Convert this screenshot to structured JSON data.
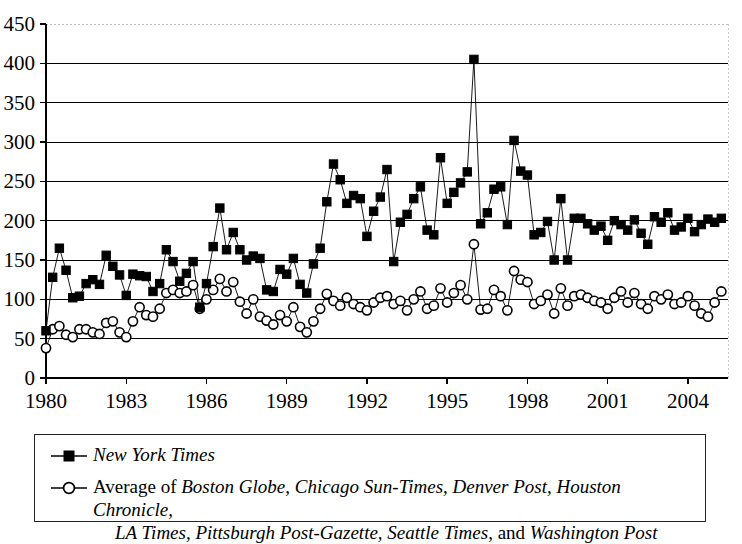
{
  "chart_data": {
    "type": "line",
    "title": "",
    "subtitle": "",
    "xlabel": "",
    "ylabel": "",
    "xlim": [
      1980,
      2005.5
    ],
    "ylim": [
      0,
      450
    ],
    "y_ticks": [
      0,
      50,
      100,
      150,
      200,
      250,
      300,
      350,
      400,
      450
    ],
    "x_ticks": [
      1980,
      1983,
      1986,
      1989,
      1992,
      1995,
      1998,
      2001,
      2004
    ],
    "x_tick_labels": [
      "1980",
      "1983",
      "1986",
      "1989",
      "1992",
      "1995",
      "1998",
      "2001",
      "2004"
    ],
    "grid": "horizontal",
    "legend_position": "below-plot",
    "frequency": "quarterly",
    "series": [
      {
        "name": "New York Times",
        "marker": "filled-square",
        "color": "#000000",
        "x": [
          1980.0,
          1980.25,
          1980.5,
          1980.75,
          1981.0,
          1981.25,
          1981.5,
          1981.75,
          1982.0,
          1982.25,
          1982.5,
          1982.75,
          1983.0,
          1983.25,
          1983.5,
          1983.75,
          1984.0,
          1984.25,
          1984.5,
          1984.75,
          1985.0,
          1985.25,
          1985.5,
          1985.75,
          1986.0,
          1986.25,
          1986.5,
          1986.75,
          1987.0,
          1987.25,
          1987.5,
          1987.75,
          1988.0,
          1988.25,
          1988.5,
          1988.75,
          1989.0,
          1989.25,
          1989.5,
          1989.75,
          1990.0,
          1990.25,
          1990.5,
          1990.75,
          1991.0,
          1991.25,
          1991.5,
          1991.75,
          1992.0,
          1992.25,
          1992.5,
          1992.75,
          1993.0,
          1993.25,
          1993.5,
          1993.75,
          1994.0,
          1994.25,
          1994.5,
          1994.75,
          1995.0,
          1995.25,
          1995.5,
          1995.75,
          1996.0,
          1996.25,
          1996.5,
          1996.75,
          1997.0,
          1997.25,
          1997.5,
          1997.75,
          1998.0,
          1998.25,
          1998.5,
          1998.75,
          1999.0,
          1999.25,
          1999.5,
          1999.75,
          2000.0,
          2000.25,
          2000.5,
          2000.75,
          2001.0,
          2001.25,
          2001.5,
          2001.75,
          2002.0,
          2002.25,
          2002.5,
          2002.75,
          2003.0,
          2003.25,
          2003.5,
          2003.75,
          2004.0,
          2004.25,
          2004.5,
          2004.75,
          2005.0,
          2005.25
        ],
        "values": [
          60,
          128,
          165,
          137,
          102,
          104,
          120,
          125,
          119,
          156,
          142,
          131,
          105,
          132,
          130,
          129,
          110,
          120,
          163,
          148,
          123,
          133,
          148,
          90,
          120,
          167,
          216,
          163,
          185,
          163,
          150,
          155,
          152,
          112,
          110,
          138,
          132,
          152,
          119,
          108,
          145,
          165,
          224,
          272,
          252,
          222,
          232,
          228,
          180,
          212,
          230,
          265,
          148,
          198,
          208,
          228,
          243,
          188,
          182,
          280,
          222,
          236,
          248,
          262,
          405,
          196,
          210,
          240,
          243,
          195,
          302,
          263,
          258,
          182,
          185,
          199,
          150,
          228,
          150,
          203,
          203,
          196,
          188,
          193,
          175,
          200,
          195,
          188,
          201,
          184,
          170,
          205,
          198,
          210,
          188,
          192,
          203,
          186,
          195,
          202,
          198,
          203
        ]
      },
      {
        "name": "Average of other newspapers",
        "marker": "open-circle",
        "color": "#000000",
        "x": [
          1980.0,
          1980.25,
          1980.5,
          1980.75,
          1981.0,
          1981.25,
          1981.5,
          1981.75,
          1982.0,
          1982.25,
          1982.5,
          1982.75,
          1983.0,
          1983.25,
          1983.5,
          1983.75,
          1984.0,
          1984.25,
          1984.5,
          1984.75,
          1985.0,
          1985.25,
          1985.5,
          1985.75,
          1986.0,
          1986.25,
          1986.5,
          1986.75,
          1987.0,
          1987.25,
          1987.5,
          1987.75,
          1988.0,
          1988.25,
          1988.5,
          1988.75,
          1989.0,
          1989.25,
          1989.5,
          1989.75,
          1990.0,
          1990.25,
          1990.5,
          1990.75,
          1991.0,
          1991.25,
          1991.5,
          1991.75,
          1992.0,
          1992.25,
          1992.5,
          1992.75,
          1993.0,
          1993.25,
          1993.5,
          1993.75,
          1994.0,
          1994.25,
          1994.5,
          1994.75,
          1995.0,
          1995.25,
          1995.5,
          1995.75,
          1996.0,
          1996.25,
          1996.5,
          1996.75,
          1997.0,
          1997.25,
          1997.5,
          1997.75,
          1998.0,
          1998.25,
          1998.5,
          1998.75,
          1999.0,
          1999.25,
          1999.5,
          1999.75,
          2000.0,
          2000.25,
          2000.5,
          2000.75,
          2001.0,
          2001.25,
          2001.5,
          2001.75,
          2002.0,
          2002.25,
          2002.5,
          2002.75,
          2003.0,
          2003.25,
          2003.5,
          2003.75,
          2004.0,
          2004.25,
          2004.5,
          2004.75,
          2005.0,
          2005.25
        ],
        "values": [
          38,
          62,
          66,
          55,
          52,
          62,
          62,
          58,
          56,
          70,
          72,
          58,
          52,
          72,
          90,
          80,
          78,
          88,
          108,
          112,
          108,
          110,
          118,
          88,
          100,
          112,
          126,
          110,
          122,
          97,
          82,
          100,
          78,
          73,
          68,
          80,
          72,
          90,
          65,
          58,
          72,
          88,
          107,
          98,
          92,
          102,
          94,
          90,
          86,
          96,
          102,
          104,
          94,
          98,
          86,
          100,
          110,
          88,
          92,
          114,
          96,
          108,
          118,
          100,
          170,
          87,
          88,
          112,
          104,
          86,
          136,
          125,
          122,
          94,
          98,
          106,
          82,
          114,
          92,
          104,
          106,
          102,
          98,
          96,
          88,
          102,
          110,
          96,
          108,
          94,
          88,
          104,
          100,
          106,
          94,
          96,
          104,
          92,
          82,
          78,
          96,
          110
        ]
      }
    ]
  },
  "legend": {
    "series1": {
      "marker": "filled-square-with-line",
      "label_italic": "New York Times"
    },
    "series2": {
      "marker": "open-circle-with-line",
      "prefix": "Average of ",
      "papers_line1": "Boston Globe, Chicago Sun-Times, Denver Post, Houston Chronicle,",
      "papers_line2a": "LA Times, Pittsburgh Post-Gazette, Seattle Times",
      "conjunction": ", and ",
      "papers_line2b": "Washington Post"
    }
  }
}
